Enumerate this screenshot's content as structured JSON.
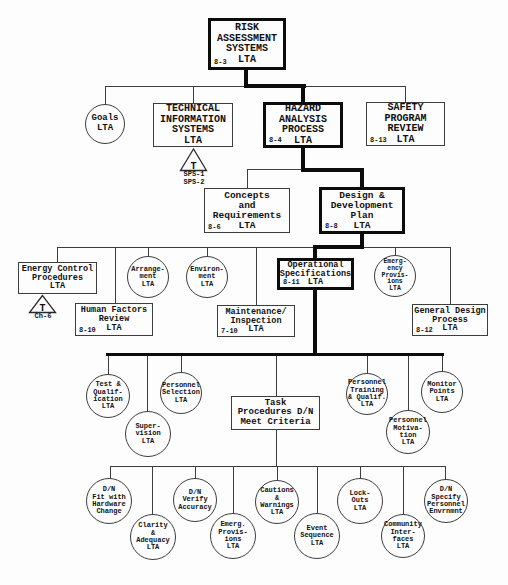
{
  "diagram": {
    "colors": {
      "ink": "#111111",
      "line": "#3d3d3d",
      "bold_line": "#0c0c0c"
    },
    "nodes": {
      "risk": {
        "label": "RISK\nASSESSMENT\nSYSTEMS\nLTA",
        "ref": "8-3"
      },
      "goals": {
        "label": "Goals\nLTA"
      },
      "technical_information": {
        "label": "TECHNICAL\nINFORMATION\nSYSTEMS\nLTA"
      },
      "hazard": {
        "label": "HAZARD\nANALYSIS\nPROCESS\nLTA",
        "ref": "8-4"
      },
      "safety": {
        "label": "SAFETY\nPROGRAM\nREVIEW\nLTA",
        "ref": "8-13"
      },
      "concepts": {
        "label": "Concepts\nand\nRequirements\nLTA",
        "ref": "8-6"
      },
      "design": {
        "label": "Design &\nDevelopment\nPlan\nLTA",
        "ref": "8-8"
      },
      "energy": {
        "label": "Energy Control\nProcedures\nLTA"
      },
      "arrangement": {
        "label": "Arrange-\nment\nLTA"
      },
      "environment": {
        "label": "Environ-\nment\nLTA"
      },
      "opspec": {
        "label": "Operational\nSpecifications\nLTA",
        "ref": "8-11"
      },
      "emerg_provisions_upper": {
        "label": "Emerg-\nency\nProvis-\nions\nLTA"
      },
      "human_factors": {
        "label": "Human Factors\nReview\nLTA",
        "ref": "8-10"
      },
      "maintenance": {
        "label": "Maintenance/\nInspection\nLTA",
        "ref": "7-10"
      },
      "general_design": {
        "label": "General Design\nProcess\nLTA",
        "ref": "8-12"
      },
      "test_qualification": {
        "label": "Test &\nQualif-\nication\nLTA"
      },
      "supervision": {
        "label": "Super-\nvision\nLTA"
      },
      "personnel_selection": {
        "label": "Personnel\nSelection\nLTA"
      },
      "task_procedures": {
        "label": "Task\nProcedures D/N\nMeet Criteria"
      },
      "personnel_training": {
        "label": "Personnel\nTraining\n& Qualif.\nLTA"
      },
      "personnel_motivation": {
        "label": "Personnel\nMotiva-\ntion\nLTA"
      },
      "monitor_points": {
        "label": "Monitor\nPoints\nLTA"
      },
      "dn_fit_hardware": {
        "label": "D/N\nFit with\nHardware\nChange"
      },
      "clarity_adequacy": {
        "label": "Clarity\n&\nAdequacy\nLTA"
      },
      "dn_verify_accuracy": {
        "label": "D/N\nVerify\nAccuracy"
      },
      "emerg_provisions_lower": {
        "label": "Emerg.\nProvis-\nions\nLTA"
      },
      "cautions_warnings": {
        "label": "Cautions\n&\nWarnings\nLTA"
      },
      "event_sequence": {
        "label": "Event\nSequence\nLTA"
      },
      "lock_outs": {
        "label": "Lock-\nOuts\nLTA"
      },
      "community_interfaces": {
        "label": "Community\nInter-\nfaces\nLTA"
      },
      "dn_specify_envrnmnt": {
        "label": "D/N\nSpecify\nPersonnel\nEnvrnmnt"
      }
    },
    "transfers": {
      "tis_transfer": {
        "symbol": "T",
        "refs": "SPS-1\nSPS-2"
      },
      "energy_transfer": {
        "symbol": "T",
        "refs": "Ch-6"
      }
    }
  }
}
